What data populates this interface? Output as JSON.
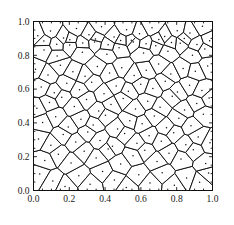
{
  "figure": {
    "title": "",
    "background_color": "#ffffff",
    "line_color": "#101010",
    "point_color": "#101010"
  },
  "axes": {
    "frame_color": "#101010",
    "x_tick_labels": [
      "0.0",
      "0.2",
      "0.4",
      "0.6",
      "0.8",
      "1.0"
    ],
    "y_tick_labels": [
      "0.0",
      "0.2",
      "0.4",
      "0.6",
      "0.8",
      "1.0"
    ],
    "x_tick_values": [
      0.0,
      0.2,
      0.4,
      0.6,
      0.8,
      1.0
    ],
    "y_tick_values": [
      0.0,
      0.2,
      0.4,
      0.6,
      0.8,
      1.0
    ],
    "xlabel": "",
    "ylabel": ""
  },
  "chart_data": {
    "type": "scatter",
    "title": "",
    "xlabel": "",
    "ylabel": "",
    "xlim": [
      0.0,
      1.0
    ],
    "ylim": [
      0.0,
      1.0
    ],
    "grid": false,
    "legend": null,
    "annotations": [
      "Voronoi tessellation of the unit square"
    ],
    "series": [
      {
        "name": "Voronoi generator points",
        "marker": "dot",
        "x": [
          0.035,
          0.108,
          0.176,
          0.253,
          0.316,
          0.386,
          0.452,
          0.518,
          0.588,
          0.651,
          0.719,
          0.787,
          0.855,
          0.928,
          0.978,
          0.063,
          0.139,
          0.21,
          0.283,
          0.35,
          0.417,
          0.487,
          0.556,
          0.622,
          0.69,
          0.757,
          0.824,
          0.893,
          0.962,
          0.028,
          0.097,
          0.166,
          0.236,
          0.303,
          0.372,
          0.441,
          0.509,
          0.578,
          0.646,
          0.714,
          0.783,
          0.851,
          0.92,
          0.986,
          0.051,
          0.124,
          0.194,
          0.265,
          0.333,
          0.402,
          0.47,
          0.538,
          0.607,
          0.675,
          0.743,
          0.812,
          0.88,
          0.949,
          0.019,
          0.089,
          0.158,
          0.228,
          0.296,
          0.364,
          0.433,
          0.501,
          0.57,
          0.638,
          0.707,
          0.775,
          0.844,
          0.912,
          0.981,
          0.043,
          0.116,
          0.186,
          0.257,
          0.325,
          0.394,
          0.462,
          0.53,
          0.599,
          0.667,
          0.736,
          0.804,
          0.872,
          0.941,
          0.011,
          0.081,
          0.15,
          0.22,
          0.288,
          0.357,
          0.425,
          0.493,
          0.562,
          0.63,
          0.699,
          0.767,
          0.836,
          0.904,
          0.973,
          0.059,
          0.132,
          0.202,
          0.273,
          0.341,
          0.41,
          0.478,
          0.546,
          0.615,
          0.683,
          0.751,
          0.82,
          0.888,
          0.957
        ],
        "y": [
          0.097,
          0.056,
          0.024,
          0.088,
          0.037,
          0.112,
          0.062,
          0.018,
          0.093,
          0.045,
          0.105,
          0.031,
          0.074,
          0.049,
          0.103,
          0.178,
          0.214,
          0.163,
          0.232,
          0.192,
          0.246,
          0.157,
          0.205,
          0.238,
          0.171,
          0.221,
          0.186,
          0.241,
          0.16,
          0.305,
          0.268,
          0.331,
          0.287,
          0.346,
          0.296,
          0.262,
          0.338,
          0.279,
          0.324,
          0.291,
          0.342,
          0.271,
          0.316,
          0.283,
          0.402,
          0.437,
          0.376,
          0.421,
          0.388,
          0.446,
          0.364,
          0.412,
          0.395,
          0.441,
          0.371,
          0.428,
          0.383,
          0.451,
          0.486,
          0.521,
          0.552,
          0.497,
          0.538,
          0.471,
          0.509,
          0.544,
          0.482,
          0.528,
          0.493,
          0.557,
          0.476,
          0.515,
          0.548,
          0.612,
          0.579,
          0.634,
          0.596,
          0.641,
          0.572,
          0.618,
          0.587,
          0.628,
          0.604,
          0.646,
          0.583,
          0.623,
          0.591,
          0.718,
          0.684,
          0.741,
          0.702,
          0.676,
          0.733,
          0.695,
          0.726,
          0.681,
          0.712,
          0.748,
          0.689,
          0.722,
          0.706,
          0.737,
          0.832,
          0.796,
          0.861,
          0.818,
          0.878,
          0.806,
          0.845,
          0.889,
          0.813,
          0.856,
          0.824,
          0.871,
          0.801,
          0.838
        ]
      },
      {
        "name": "Voronoi generator points (upper band)",
        "marker": "dot",
        "x": [
          0.024,
          0.095,
          0.168,
          0.24,
          0.31,
          0.38,
          0.45,
          0.52,
          0.592,
          0.662,
          0.733,
          0.803,
          0.874,
          0.944,
          0.058,
          0.13,
          0.203,
          0.275,
          0.346,
          0.417,
          0.487,
          0.558,
          0.629,
          0.7,
          0.771,
          0.842,
          0.913,
          0.984
        ],
        "y": [
          0.916,
          0.944,
          0.903,
          0.958,
          0.921,
          0.969,
          0.908,
          0.951,
          0.927,
          0.963,
          0.911,
          0.946,
          0.932,
          0.972,
          0.884,
          0.866,
          0.892,
          0.873,
          0.897,
          0.862,
          0.888,
          0.879,
          0.869,
          0.894,
          0.876,
          0.899,
          0.864,
          0.886
        ]
      }
    ]
  }
}
